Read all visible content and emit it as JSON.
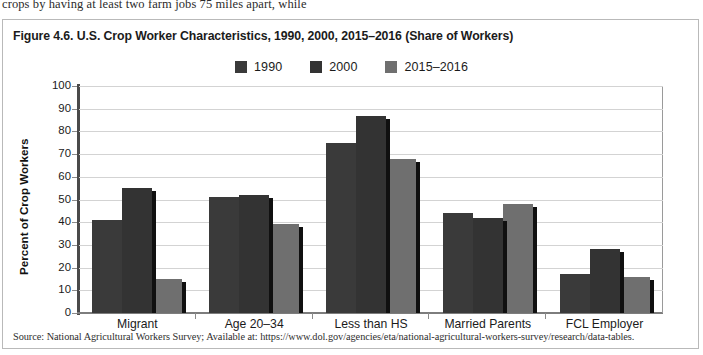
{
  "page_text_above": "crops by having at least two farm jobs 75 miles apart, while",
  "figure": {
    "title": "Figure 4.6. U.S. Crop Worker Characteristics, 1990, 2000, 2015–2016 (Share of Workers)",
    "source": "Source: National Agricultural Workers Survey; Available at: https://www.dol.gov/agencies/eta/national-agricultural-workers-survey/research/data-tables."
  },
  "colors": {
    "series_1990": "#3a3a3a",
    "series_2000": "#333333",
    "series_2015_2016": "#6f6f6f",
    "bar_shadow": "#101010",
    "gridline": "#d3d3d3",
    "axis": "#4a4a4a",
    "figure_border": "#b9b9b9"
  },
  "chart_data": {
    "type": "bar",
    "title": "Figure 4.6. U.S. Crop Worker Characteristics, 1990, 2000, 2015–2016 (Share of Workers)",
    "xlabel": "",
    "ylabel": "Percent of Crop Workers",
    "ylim": [
      0,
      100
    ],
    "yticks": [
      0,
      10,
      20,
      30,
      40,
      50,
      60,
      70,
      80,
      90,
      100
    ],
    "ytick_labels": [
      "0",
      "10",
      "20",
      "30",
      "40",
      "50",
      "60",
      "70",
      "80",
      "90",
      "100"
    ],
    "grid": true,
    "legend_position": "top-center",
    "categories": [
      "Migrant",
      "Age 20–34",
      "Less than HS",
      "Married Parents",
      "FCL Employer"
    ],
    "series": [
      {
        "name": "1990",
        "color": "#3a3a3a",
        "values": [
          41,
          51,
          75,
          44,
          17
        ]
      },
      {
        "name": "2000",
        "color": "#333333",
        "values": [
          55,
          52,
          87,
          42,
          28
        ]
      },
      {
        "name": "2015–2016",
        "color": "#6f6f6f",
        "values": [
          15,
          39,
          68,
          48,
          16
        ]
      }
    ]
  }
}
